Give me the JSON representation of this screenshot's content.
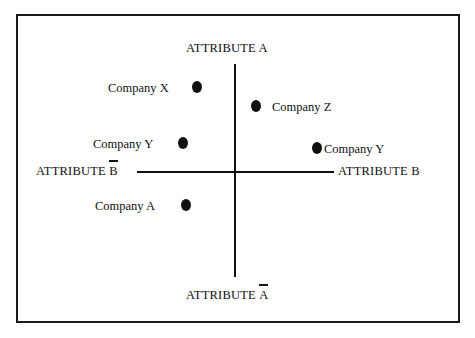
{
  "figure": {
    "type": "perceptual-map",
    "background_color": "#ffffff",
    "ink_color": "#111111",
    "frame": {
      "x": 16,
      "y": 14,
      "width": 444,
      "height": 309
    }
  },
  "axes": {
    "vertical": {
      "x": 234,
      "y": 64,
      "length": 213
    },
    "horizontal": {
      "x": 137,
      "y": 171,
      "length": 197
    },
    "labels": {
      "top": {
        "text": "ATTRIBUTE A",
        "negated": false,
        "negated_letter": "",
        "base": "",
        "x": 186,
        "y": 42
      },
      "bottom": {
        "text": "ATTRIBUTE A",
        "negated": true,
        "negated_letter": "A",
        "base": "ATTRIBUTE ",
        "x": 186,
        "y": 289
      },
      "left": {
        "text": "ATTRIBUTE B",
        "negated": true,
        "negated_letter": "B",
        "base": "ATTRIBUTE ",
        "x": 36,
        "y": 165
      },
      "right": {
        "text": "ATTRIBUTE B",
        "negated": false,
        "negated_letter": "",
        "base": "",
        "x": 338,
        "y": 165
      }
    }
  },
  "points": [
    {
      "id": "company-x",
      "label": "Company X",
      "label_side": "left",
      "label_x": 108,
      "label_y": 82,
      "dot_x": 192,
      "dot_y": 81,
      "quadrant": "top-left"
    },
    {
      "id": "company-z",
      "label": "Company Z",
      "label_side": "right",
      "label_x": 272,
      "label_y": 101,
      "dot_x": 251,
      "dot_y": 100,
      "quadrant": "top-right"
    },
    {
      "id": "company-y-left",
      "label": "Company Y",
      "label_side": "left",
      "label_x": 93,
      "label_y": 138,
      "dot_x": 178,
      "dot_y": 137,
      "quadrant": "top-left"
    },
    {
      "id": "company-y-right",
      "label": "Company Y",
      "label_side": "right",
      "label_x": 324,
      "label_y": 143,
      "dot_x": 312,
      "dot_y": 142,
      "quadrant": "top-right"
    },
    {
      "id": "company-a",
      "label": "Company A",
      "label_side": "left",
      "label_x": 95,
      "label_y": 200,
      "dot_x": 181,
      "dot_y": 199,
      "quadrant": "bottom-left"
    }
  ]
}
